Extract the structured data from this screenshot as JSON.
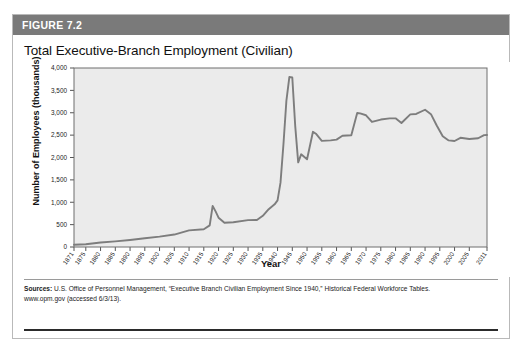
{
  "figure": {
    "number_label": "FIGURE 7.2",
    "title": "Total Executive-Branch Employment (Civilian)"
  },
  "source": {
    "prefix": "Sources:",
    "line1": " U.S. Office of Personnel Management, “Executive Branch Civilian Employment Since 1940,” Historical Federal Workforce Tables.",
    "line2": "www.opm.gov (accessed 6/3/13)."
  },
  "colors": {
    "header_bar": "#7a7a7a",
    "plot_background": "#ebebeb",
    "line": "#7d7d7d",
    "axis": "#555555",
    "card_border": "#b9b9b9"
  },
  "chart_data": {
    "type": "line",
    "title": "Total Executive-Branch Employment (Civilian)",
    "xlabel": "Year",
    "ylabel": "Number of Employees (thousands)",
    "ylim": [
      0,
      4000
    ],
    "xlim": [
      1871,
      2011
    ],
    "ytick_labels": [
      "0",
      "500",
      "1,000",
      "1,500",
      "2,000",
      "2,500",
      "3,000",
      "3,500",
      "4,000"
    ],
    "ytick_values": [
      0,
      500,
      1000,
      1500,
      2000,
      2500,
      3000,
      3500,
      4000
    ],
    "xtick_labels": [
      "1871",
      "1875",
      "1880",
      "1885",
      "1890",
      "1895",
      "1900",
      "1905",
      "1910",
      "1915",
      "1920",
      "1925",
      "1930",
      "1935",
      "1940",
      "1945",
      "1950",
      "1955",
      "1960",
      "1965",
      "1970",
      "1975",
      "1980",
      "1985",
      "1990",
      "1995",
      "2000",
      "2005",
      "2011"
    ],
    "xtick_values": [
      1871,
      1875,
      1880,
      1885,
      1890,
      1895,
      1900,
      1905,
      1910,
      1915,
      1920,
      1925,
      1930,
      1935,
      1940,
      1945,
      1950,
      1955,
      1960,
      1965,
      1970,
      1975,
      1980,
      1985,
      1990,
      1995,
      2000,
      2005,
      2011
    ],
    "grid": false,
    "legend": false,
    "series": [
      {
        "name": "Total executive-branch civilian employment",
        "x": [
          1871,
          1875,
          1880,
          1885,
          1890,
          1895,
          1900,
          1905,
          1910,
          1915,
          1917,
          1918,
          1919,
          1920,
          1922,
          1925,
          1930,
          1933,
          1935,
          1937,
          1939,
          1940,
          1941,
          1942,
          1943,
          1944,
          1945,
          1946,
          1947,
          1948,
          1950,
          1952,
          1953,
          1955,
          1958,
          1960,
          1962,
          1965,
          1967,
          1968,
          1970,
          1972,
          1975,
          1978,
          1980,
          1982,
          1985,
          1987,
          1990,
          1992,
          1994,
          1996,
          1998,
          2000,
          2002,
          2005,
          2008,
          2010,
          2011
        ],
        "values": [
          51,
          60,
          100,
          125,
          157,
          196,
          231,
          278,
          372,
          396,
          483,
          917,
          795,
          655,
          543,
          553,
          601,
          604,
          698,
          845,
          953,
          1043,
          1438,
          2296,
          3270,
          3798,
          3787,
          2696,
          1892,
          2071,
          1960,
          2574,
          2532,
          2371,
          2382,
          2399,
          2485,
          2496,
          2994,
          2985,
          2944,
          2795,
          2848,
          2875,
          2875,
          2770,
          2964,
          2973,
          3067,
          2969,
          2709,
          2473,
          2382,
          2369,
          2440,
          2414,
          2430,
          2501,
          2503
        ],
        "values_plotted_thousands": [
          51,
          60,
          100,
          125,
          157,
          196,
          231,
          278,
          372,
          396,
          483,
          917,
          795,
          655,
          543,
          553,
          601,
          604,
          698,
          845,
          953,
          1043,
          1438,
          2296,
          3270,
          3798,
          3787,
          2696,
          1892,
          2071,
          1960,
          2574,
          2532,
          2371,
          2382,
          2399,
          2485,
          2496,
          2994,
          2985,
          2944,
          2795,
          2848,
          2875,
          2875,
          2770,
          2964,
          2973,
          3067,
          2969,
          2709,
          2473,
          2382,
          2369,
          2440,
          2414,
          2430,
          2501,
          2503
        ]
      }
    ],
    "notable_points": [
      {
        "year": 1918,
        "value": 917,
        "note": "World War I peak"
      },
      {
        "year": 1944,
        "value": 3798,
        "note": "World War II peak"
      },
      {
        "year": 1947,
        "value": 1892,
        "note": "Post-war trough"
      },
      {
        "year": 2011,
        "value": 2150,
        "note": "Final value"
      }
    ]
  }
}
